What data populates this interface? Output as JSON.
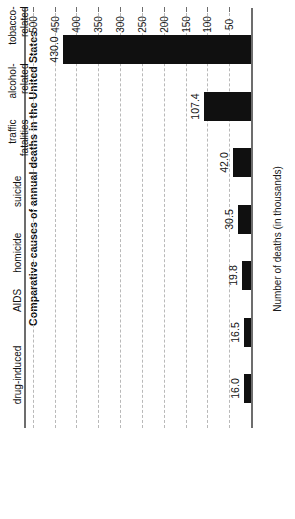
{
  "chart_data": {
    "type": "bar",
    "orientation": "vertical-rotated",
    "title": "Comparative causes of annual deaths in the United States",
    "xlabel": "",
    "ylabel": "Number of deaths (in thousands)",
    "categories": [
      "tobacco-\nrelated",
      "alcohol-\nrelated",
      "traffic\nfatalities",
      "suicide",
      "homicide",
      "AIDS",
      "drug-induced"
    ],
    "values": [
      430.0,
      107.4,
      42.0,
      30.5,
      19.8,
      16.5,
      16.0
    ],
    "value_labels": [
      "430.0",
      "107.4",
      "42.0",
      "30.5",
      "19.8",
      "16.5",
      "16.0"
    ],
    "ylim": [
      0,
      520
    ],
    "ticks": [
      50,
      100,
      150,
      200,
      250,
      300,
      350,
      400,
      450,
      500
    ],
    "tick_labels": [
      "50",
      "100",
      "150",
      "200",
      "250",
      "300",
      "350",
      "400",
      "450",
      "500"
    ],
    "grid": true,
    "legend": null,
    "bar_color": "#101010",
    "grid_color": "#b9b9b9",
    "axis_color": "#6d6d6d"
  }
}
